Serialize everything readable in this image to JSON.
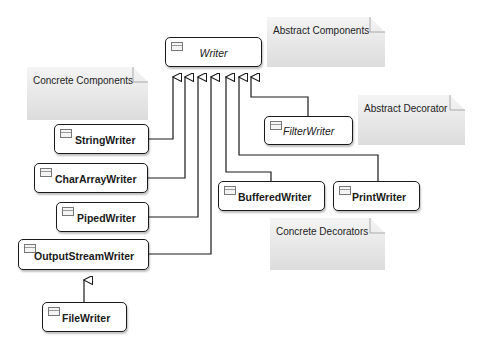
{
  "classes": {
    "writer": {
      "label": "Writer",
      "abstract": true
    },
    "string_writer": {
      "label": "StringWriter"
    },
    "char_array_writer": {
      "label": "CharArrayWriter"
    },
    "piped_writer": {
      "label": "PipedWriter"
    },
    "output_stream_writer": {
      "label": "OutputStreamWriter"
    },
    "file_writer": {
      "label": "FileWriter"
    },
    "filter_writer": {
      "label": "FilterWriter",
      "abstract": true
    },
    "buffered_writer": {
      "label": "BufferedWriter"
    },
    "print_writer": {
      "label": "PrintWriter"
    }
  },
  "notes": {
    "abstract_components": "Abstract Components",
    "concrete_components": "Concrete Components",
    "abstract_decorator": "Abstract Decorator",
    "concrete_decorators": "Concrete Decorators"
  },
  "relationships": [
    {
      "from": "StringWriter",
      "to": "Writer",
      "type": "generalization"
    },
    {
      "from": "CharArrayWriter",
      "to": "Writer",
      "type": "generalization"
    },
    {
      "from": "PipedWriter",
      "to": "Writer",
      "type": "generalization"
    },
    {
      "from": "OutputStreamWriter",
      "to": "Writer",
      "type": "generalization"
    },
    {
      "from": "BufferedWriter",
      "to": "Writer",
      "type": "generalization"
    },
    {
      "from": "PrintWriter",
      "to": "Writer",
      "type": "generalization"
    },
    {
      "from": "FilterWriter",
      "to": "Writer",
      "type": "generalization"
    },
    {
      "from": "FileWriter",
      "to": "OutputStreamWriter",
      "type": "generalization"
    }
  ],
  "colors": {
    "line": "#1a1a1a",
    "note_fill": "#e6e6e6",
    "box_fill": "#ffffff"
  }
}
